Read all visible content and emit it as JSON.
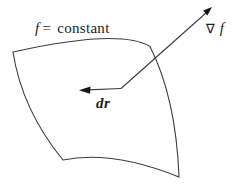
{
  "figure": {
    "surface_label": {
      "f": "f",
      "equals": "=",
      "value": "constant"
    },
    "gradient_label": {
      "nabla": "∇",
      "f": "f"
    },
    "dr_label": "dr"
  },
  "colors": {
    "stroke": "#3d3d3d",
    "arrow_fill": "#161616",
    "background": "#ffffff"
  }
}
